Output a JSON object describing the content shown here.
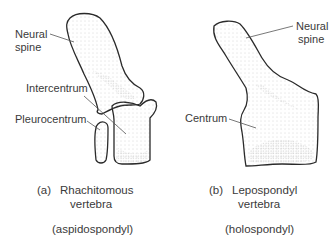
{
  "figure": {
    "panel_a": {
      "labels": {
        "neural_spine_1": "Neural",
        "neural_spine_2": "spine",
        "intercentrum": "Intercentrum",
        "pleurocentrum": "Pleurocentrum"
      },
      "caption_letter": "(a)",
      "caption_line1": "Rhachitomous",
      "caption_line2": "vertebra",
      "caption_type": "(aspidospondyl)"
    },
    "panel_b": {
      "labels": {
        "neural_spine_1": "Neural",
        "neural_spine_2": "spine",
        "centrum": "Centrum"
      },
      "caption_letter": "(b)",
      "caption_line1": "Lepospondyl",
      "caption_line2": "vertebra",
      "caption_type": "(holospondyl)"
    }
  },
  "colors": {
    "outline": "#2a2a2a",
    "stipple": "#9a9a9a",
    "leader": "#555555",
    "text": "#3a3a3a"
  }
}
